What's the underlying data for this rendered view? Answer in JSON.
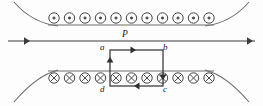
{
  "figure": {
    "stroke_color": "#3c3c3c",
    "label_color": "#1b1b1b",
    "background_color": "#fdfdfd"
  },
  "conductor": {
    "label": "P",
    "name": "straight-current-wire",
    "direction": "right",
    "y": 41,
    "x_start": 8,
    "x_end": 255,
    "arrow_positions": [
      30,
      253
    ]
  },
  "top_field_region": {
    "name": "magnetic-field-out-of-page",
    "symbol": "dot",
    "symbol_count": 11,
    "row_y": 18,
    "x_start": 54,
    "x_spacing": 15.5,
    "radius": 5.2,
    "inner_radius": 1.1,
    "baseline_y": 25,
    "baseline_x_start": 48,
    "baseline_x_end": 214
  },
  "bottom_field_region": {
    "name": "magnetic-field-into-page",
    "symbol": "cross",
    "symbol_count": 11,
    "row_y": 78,
    "x_start": 54,
    "x_spacing": 15.5,
    "radius": 5.2,
    "baseline_y": 71,
    "baseline_x_start": 48,
    "baseline_x_end": 214
  },
  "loop": {
    "name": "rectangular-loop-abcd",
    "current_direction": "clockwise",
    "left_x": 110,
    "right_x": 163,
    "top_y": 50,
    "bottom_y": 86,
    "vertices": [
      {
        "id": "a",
        "label": "a",
        "position": "top-left",
        "x": 110,
        "y": 50
      },
      {
        "id": "b",
        "label": "b",
        "position": "top-right",
        "x": 163,
        "y": 50
      },
      {
        "id": "c",
        "label": "c",
        "position": "bottom-right",
        "x": 163,
        "y": 86
      },
      {
        "id": "d",
        "label": "d",
        "position": "bottom-left",
        "x": 110,
        "y": 86
      }
    ],
    "edges": [
      {
        "from": "a",
        "to": "b",
        "arrow": "right",
        "arrow_at": 136
      },
      {
        "from": "b",
        "to": "c",
        "arrow": "down",
        "arrow_at": 80
      },
      {
        "from": "c",
        "to": "d",
        "arrow": "left",
        "arrow_at": 134
      },
      {
        "from": "d",
        "to": "a",
        "arrow": "up",
        "arrow_at": 57
      }
    ]
  },
  "pole_curves": {
    "name": "pole-piece-outlines",
    "top_left": "M 14 2 C 26 16, 42 24, 58 26",
    "top_right": "M 249 2 C 237 16, 221 24, 205 26",
    "bottom_left": "M 14 102 C 26 88, 42 74, 58 70",
    "bottom_right": "M 249 102 C 237 88, 221 74, 205 70"
  }
}
